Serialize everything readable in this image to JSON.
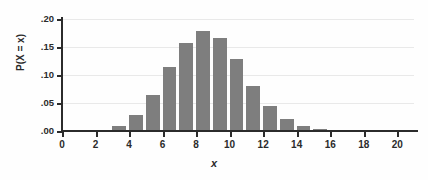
{
  "chart_data": {
    "type": "bar",
    "title": "",
    "subtitle": "",
    "xlabel": "x",
    "ylabel": "P(X = x)",
    "xlim": [
      0,
      21
    ],
    "ylim": [
      0.0,
      0.2
    ],
    "grid": true,
    "legend": null,
    "bar_color": "#7e7e7e",
    "axis_color": "#2b2b2b",
    "grid_color": "#e9e9e9",
    "x_ticks": [
      0,
      2,
      4,
      6,
      8,
      10,
      12,
      14,
      16,
      18,
      20
    ],
    "x_tick_labels": [
      "0",
      "2",
      "4",
      "6",
      "8",
      "10",
      "12",
      "14",
      "16",
      "18",
      "20"
    ],
    "y_ticks": [
      0.0,
      0.05,
      0.1,
      0.15,
      0.2
    ],
    "y_tick_labels": [
      ".00",
      ".05",
      ".10",
      ".15",
      ".20"
    ],
    "categories": [
      0,
      1,
      2,
      3,
      4,
      5,
      6,
      7,
      8,
      9,
      10,
      11,
      12,
      13,
      14,
      15,
      16,
      17,
      18,
      19,
      20
    ],
    "values": [
      0.0,
      0.0,
      0.001,
      0.009,
      0.029,
      0.065,
      0.114,
      0.158,
      0.179,
      0.166,
      0.128,
      0.081,
      0.045,
      0.022,
      0.009,
      0.003,
      0.001,
      0.0,
      0.0,
      0.0,
      0.0
    ],
    "bar_width_units": 0.82,
    "bar_align": "left-of-tick"
  }
}
